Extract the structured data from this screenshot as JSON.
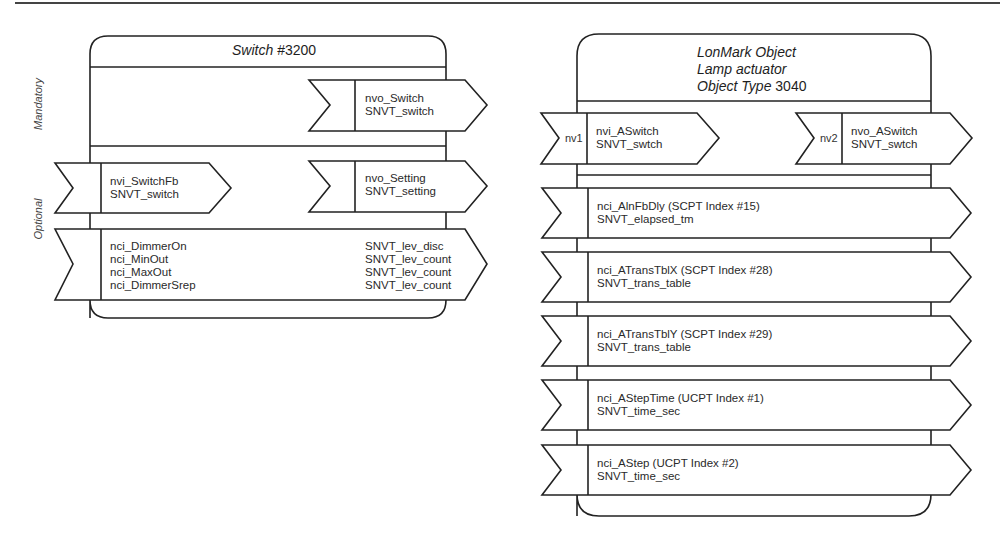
{
  "switch_object": {
    "title_italic": "Switch",
    "title_number": "#3200",
    "section_labels": {
      "mandatory": "Mandatory",
      "optional": "Optional"
    },
    "mandatory_outputs": [
      {
        "name": "nvo_Switch",
        "type": "SNVT_switch"
      }
    ],
    "optional_inputs": [
      {
        "name": "nvi_SwitchFb",
        "type": "SNVT_switch"
      }
    ],
    "optional_outputs": [
      {
        "name": "nvo_Setting",
        "type": "SNVT_setting"
      }
    ],
    "config_properties": [
      {
        "name": "nci_DimmerOn",
        "type": "SNVT_lev_disc"
      },
      {
        "name": "nci_MinOut",
        "type": "SNVT_lev_count"
      },
      {
        "name": "nci_MaxOut",
        "type": "SNVT_lev_count"
      },
      {
        "name": "nci_DimmerSrep",
        "type": "SNVT_lev_count"
      }
    ]
  },
  "lamp_object": {
    "title_line1": "LonMark Object",
    "title_line2": "Lamp actuator",
    "title_line3_italic": "Object Type",
    "title_line3_number": "3040",
    "inputs": [
      {
        "tag": "nv1",
        "name": "nvi_ASwitch",
        "type": "SNVT_swtch"
      }
    ],
    "outputs": [
      {
        "tag": "nv2",
        "name": "nvo_ASwitch",
        "type": "SNVT_swtch"
      }
    ],
    "config_properties": [
      {
        "name": "nci_AlnFbDly (SCPT Index #15)",
        "type": "SNVT_elapsed_tm"
      },
      {
        "name": "nci_ATransTblX (SCPT Index #28)",
        "type": "SNVT_trans_table"
      },
      {
        "name": "nci_ATransTblY (SCPT Index #29)",
        "type": "SNVT_trans_table"
      },
      {
        "name": "nci_AStepTime (UCPT Index #1)",
        "type": "SNVT_time_sec"
      },
      {
        "name": "nci_AStep (UCPT Index #2)",
        "type": "SNVT_time_sec"
      }
    ]
  },
  "colors": {
    "stroke": "#222222",
    "background": "#ffffff"
  }
}
